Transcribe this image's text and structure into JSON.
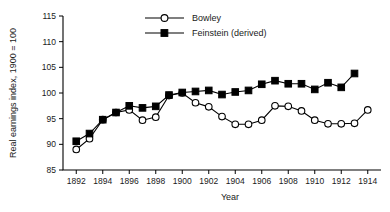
{
  "chart_data": {
    "type": "line",
    "title": "",
    "xlabel": "Year",
    "ylabel": "Real earnings index, 1900 = 100",
    "xlim": [
      1891,
      1915
    ],
    "ylim": [
      85,
      115
    ],
    "ytick_labels": [
      "85",
      "90",
      "95",
      "100",
      "105",
      "110",
      "115"
    ],
    "yticks": [
      85,
      90,
      95,
      100,
      105,
      110,
      115
    ],
    "xtick_labels": [
      "1892",
      "1894",
      "1896",
      "1898",
      "1900",
      "1902",
      "1904",
      "1906",
      "1908",
      "1910",
      "1912",
      "1914"
    ],
    "xticks": [
      1892,
      1894,
      1896,
      1898,
      1900,
      1902,
      1904,
      1906,
      1908,
      1910,
      1912,
      1914
    ],
    "grid": false,
    "legend_position": "top-center",
    "series": [
      {
        "name": "Bowley",
        "marker": "open-circle",
        "x": [
          1892,
          1893,
          1894,
          1895,
          1896,
          1897,
          1898,
          1899,
          1900,
          1901,
          1902,
          1903,
          1904,
          1905,
          1906,
          1907,
          1908,
          1909,
          1910,
          1911,
          1912,
          1913,
          1914
        ],
        "values": [
          89.0,
          91.1,
          94.8,
          96.2,
          96.7,
          94.7,
          95.3,
          99.5,
          100.0,
          98.1,
          97.3,
          95.4,
          93.9,
          93.9,
          94.7,
          97.5,
          97.4,
          96.5,
          94.7,
          94.0,
          94.0,
          94.1,
          96.7
        ]
      },
      {
        "name": "Feinstein (derived)",
        "marker": "filled-square",
        "x": [
          1892,
          1893,
          1894,
          1895,
          1896,
          1897,
          1898,
          1899,
          1900,
          1901,
          1902,
          1903,
          1904,
          1905,
          1906,
          1907,
          1908,
          1909,
          1910,
          1911,
          1912,
          1913
        ],
        "values": [
          90.6,
          92.1,
          94.8,
          96.2,
          97.5,
          97.1,
          97.4,
          99.6,
          100.1,
          100.3,
          100.5,
          99.7,
          100.2,
          100.5,
          101.7,
          102.4,
          101.8,
          101.8,
          100.7,
          102.0,
          101.1,
          103.8
        ]
      }
    ]
  },
  "legend": {
    "items": [
      {
        "label": "Bowley"
      },
      {
        "label": "Feinstein (derived)"
      }
    ]
  },
  "axes": {
    "y_title": "Real earnings index, 1900 = 100",
    "x_title": "Year"
  }
}
